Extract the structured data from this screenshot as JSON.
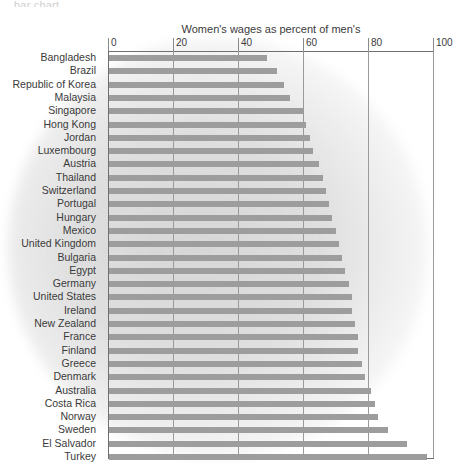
{
  "top_sliver_text": "bar chart",
  "chart_data": {
    "type": "bar",
    "orientation": "horizontal",
    "title": "Women's wages as percent of men's",
    "xlabel": "",
    "ylabel": "",
    "xlim": [
      0,
      100
    ],
    "xticks": [
      0,
      20,
      40,
      60,
      80,
      100
    ],
    "xtick_labels": [
      "0",
      "20",
      "40",
      "60",
      "80",
      "100"
    ],
    "grid": true,
    "grid_axis": "x",
    "legend": false,
    "bar_color": "#9d9d9d",
    "categories": [
      "Bangladesh",
      "Brazil",
      "Republic of Korea",
      "Malaysia",
      "Singapore",
      "Hong Kong",
      "Jordan",
      "Luxembourg",
      "Austria",
      "Thailand",
      "Switzerland",
      "Portugal",
      "Hungary",
      "Mexico",
      "United Kingdom",
      "Bulgaria",
      "Egypt",
      "Germany",
      "United States",
      "Ireland",
      "New Zealand",
      "France",
      "Finland",
      "Greece",
      "Denmark",
      "Australia",
      "Costa Rica",
      "Norway",
      "Sweden",
      "El Salvador",
      "Turkey"
    ],
    "values": [
      49,
      52,
      54,
      56,
      60,
      61,
      62,
      63,
      65,
      66,
      67,
      68,
      69,
      70,
      71,
      72,
      73,
      74,
      75,
      75,
      76,
      77,
      77,
      78,
      79,
      81,
      82,
      83,
      86,
      92,
      98
    ]
  }
}
